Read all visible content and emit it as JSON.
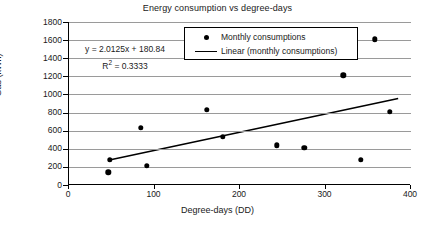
{
  "chart_data": {
    "type": "scatter",
    "title": "Energy consumption vs degree-days",
    "xlabel": "Degree-days (DD)",
    "ylabel": "Gas (kWh)",
    "xlim": [
      0,
      400
    ],
    "ylim": [
      0,
      1800
    ],
    "xticks": [
      0,
      100,
      200,
      300,
      400
    ],
    "yticks": [
      0,
      200,
      400,
      600,
      800,
      1000,
      1200,
      1400,
      1600,
      1800
    ],
    "grid": "horizontal",
    "legend_position": "top-center",
    "series": [
      {
        "name": "Monthly consumptions",
        "type": "scatter",
        "marker": "filled-circle",
        "color": "#000000",
        "points": [
          {
            "x": 46,
            "y": 140
          },
          {
            "x": 48,
            "y": 280
          },
          {
            "x": 84,
            "y": 630
          },
          {
            "x": 91,
            "y": 210
          },
          {
            "x": 161,
            "y": 830
          },
          {
            "x": 180,
            "y": 530
          },
          {
            "x": 243,
            "y": 440
          },
          {
            "x": 275,
            "y": 410
          },
          {
            "x": 321,
            "y": 1210
          },
          {
            "x": 341,
            "y": 280
          },
          {
            "x": 358,
            "y": 1610
          },
          {
            "x": 375,
            "y": 810
          }
        ]
      },
      {
        "name": "Linear (monthly consumptions)",
        "type": "line",
        "color": "#000000",
        "fit": {
          "slope": 2.0125,
          "intercept": 180.84,
          "r_squared": 0.3333
        },
        "endpoints": [
          {
            "x": 50,
            "y": 281.47
          },
          {
            "x": 385,
            "y": 955.65
          }
        ]
      }
    ],
    "annotations": {
      "equation_y": "y",
      "equation_rest": " = 2.0125x + 180.84",
      "r2_label": "R",
      "r2_sup": "2",
      "r2_rest": " = 0.3333"
    },
    "legend": [
      {
        "label": "Monthly consumptions",
        "key": "dot-marker"
      },
      {
        "label": "Linear (monthly consumptions)",
        "key": "line-marker"
      }
    ]
  }
}
